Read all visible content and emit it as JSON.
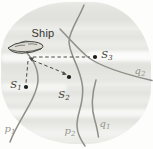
{
  "figure": {
    "description_labels": {
      "ship": "Ship",
      "s1": {
        "base": "S",
        "sub": "1"
      },
      "s2": {
        "base": "S",
        "sub": "2"
      },
      "s3": {
        "base": "S",
        "sub": "3"
      },
      "p1": {
        "base": "p",
        "sub": "1"
      },
      "p2": {
        "base": "p",
        "sub": "2"
      },
      "q1": {
        "base": "q",
        "sub": "1"
      },
      "q2": {
        "base": "q",
        "sub": "2"
      }
    },
    "colors": {
      "curve_stroke": "#8f8f89",
      "dashed_line": "#4a4a45",
      "station_dot": "#1c1c19",
      "gray_label": "#94948c",
      "dark_label": "#3a3a33",
      "wash_background": "#e7e7e3",
      "ship_fill": "#dcdcd5"
    }
  }
}
